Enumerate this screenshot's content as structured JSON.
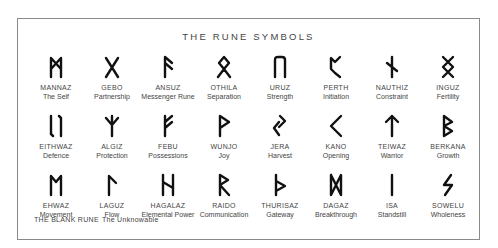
{
  "title": "THE RUNE SYMBOLS",
  "runes": [
    {
      "name": "MANNAZ",
      "meaning": "The Self",
      "glyph": "mannaz"
    },
    {
      "name": "GEBO",
      "meaning": "Partnership",
      "glyph": "gebo"
    },
    {
      "name": "ANSUZ",
      "meaning": "Messenger Rune",
      "glyph": "ansuz"
    },
    {
      "name": "OTHILA",
      "meaning": "Separation",
      "glyph": "othila"
    },
    {
      "name": "URUZ",
      "meaning": "Strength",
      "glyph": "uruz"
    },
    {
      "name": "PERTH",
      "meaning": "Initiation",
      "glyph": "perth"
    },
    {
      "name": "NAUTHIZ",
      "meaning": "Constraint",
      "glyph": "nauthiz"
    },
    {
      "name": "INGUZ",
      "meaning": "Fertility",
      "glyph": "inguz"
    },
    {
      "name": "EITHWAZ",
      "meaning": "Defence",
      "glyph": "eithwaz"
    },
    {
      "name": "ALGIZ",
      "meaning": "Protection",
      "glyph": "algiz"
    },
    {
      "name": "FEBU",
      "meaning": "Possessions",
      "glyph": "febu"
    },
    {
      "name": "WUNJO",
      "meaning": "Joy",
      "glyph": "wunjo"
    },
    {
      "name": "JERA",
      "meaning": "Harvest",
      "glyph": "jera"
    },
    {
      "name": "KANO",
      "meaning": "Opening",
      "glyph": "kano"
    },
    {
      "name": "TEIWAZ",
      "meaning": "Warrior",
      "glyph": "teiwaz"
    },
    {
      "name": "BERKANA",
      "meaning": "Growth",
      "glyph": "berkana"
    },
    {
      "name": "EHWAZ",
      "meaning": "Movement",
      "glyph": "ehwaz"
    },
    {
      "name": "LAGUZ",
      "meaning": "Flow",
      "glyph": "laguz"
    },
    {
      "name": "HAGALAZ",
      "meaning": "Elemental Power",
      "glyph": "hagalaz"
    },
    {
      "name": "RAIDO",
      "meaning": "Communication",
      "glyph": "raido"
    },
    {
      "name": "THURISAZ",
      "meaning": "Gateway",
      "glyph": "thurisaz"
    },
    {
      "name": "DAGAZ",
      "meaning": "Breakthrough",
      "glyph": "dagaz"
    },
    {
      "name": "ISA",
      "meaning": "Standstill",
      "glyph": "isa"
    },
    {
      "name": "SOWELU",
      "meaning": "Wholeness",
      "glyph": "sowelu"
    }
  ],
  "blank_rune": {
    "name": "THE BLANK RUNE",
    "meaning": "The Unknowable"
  },
  "colors": {
    "border": "#8a8a8a",
    "glyph": "#111111",
    "text": "#444444"
  }
}
